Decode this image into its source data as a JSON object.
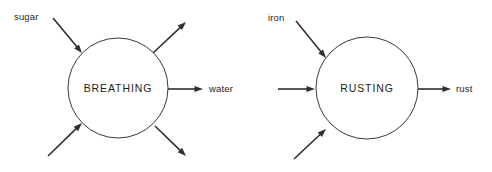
{
  "canvas": {
    "width": 492,
    "height": 172,
    "background": "#ffffff",
    "stroke_color": "#2e2e2e",
    "circle_stroke_color": "#3a3a3a",
    "text_color": "#1d1d1d"
  },
  "diagrams": [
    {
      "id": "breathing",
      "process_label": "BREATHING",
      "circle": {
        "cx": 118,
        "cy": 88,
        "r": 50
      },
      "inputs": [
        {
          "id": "sugar",
          "label": "sugar",
          "label_x": 14,
          "label_y": 13,
          "x1": 53,
          "y1": 18,
          "x2": 82,
          "y2": 53
        },
        {
          "id": "input-lower-left",
          "label": "",
          "label_x": 0,
          "label_y": 0,
          "x1": 48,
          "y1": 156,
          "x2": 82,
          "y2": 123
        }
      ],
      "outputs": [
        {
          "id": "output-upper-right",
          "label": "",
          "label_x": 0,
          "label_y": 0,
          "x1": 153,
          "y1": 53,
          "x2": 186,
          "y2": 22
        },
        {
          "id": "water",
          "label": "water",
          "label_x": 209,
          "label_y": 92,
          "x1": 168,
          "y1": 89,
          "x2": 203,
          "y2": 89
        },
        {
          "id": "output-lower-right",
          "label": "",
          "label_x": 0,
          "label_y": 0,
          "x1": 155,
          "y1": 126,
          "x2": 186,
          "y2": 156
        }
      ]
    },
    {
      "id": "rusting",
      "process_label": "RUSTING",
      "circle": {
        "cx": 367,
        "cy": 88,
        "r": 51
      },
      "inputs": [
        {
          "id": "iron",
          "label": "iron",
          "label_x": 268,
          "label_y": 14,
          "x1": 296,
          "y1": 21,
          "x2": 326,
          "y2": 58
        },
        {
          "id": "input-left",
          "label": "",
          "label_x": 0,
          "label_y": 0,
          "x1": 278,
          "y1": 89,
          "x2": 315,
          "y2": 89
        },
        {
          "id": "input-lower-left",
          "label": "",
          "label_x": 0,
          "label_y": 0,
          "x1": 294,
          "y1": 159,
          "x2": 326,
          "y2": 129
        }
      ],
      "outputs": [
        {
          "id": "rust",
          "label": "rust",
          "label_x": 456,
          "label_y": 92,
          "x1": 418,
          "y1": 89,
          "x2": 451,
          "y2": 89
        }
      ]
    }
  ]
}
